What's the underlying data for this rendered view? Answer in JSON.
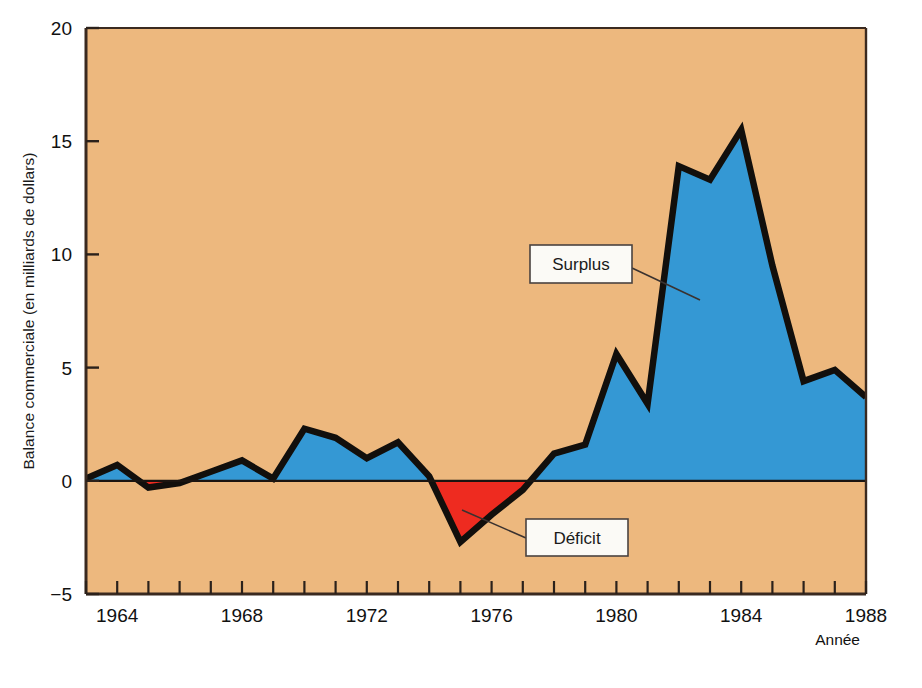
{
  "figure": {
    "background_color": "#ffffff",
    "plot_background_color": "#edb87e",
    "axis_color": "#3a2a20",
    "surplus_color": "#3498d4",
    "deficit_color": "#ee2b20",
    "line_color": "#120f0c"
  },
  "axes": {
    "y_title": "Balance commerciale (en milliards de dollars)",
    "x_title": "Année",
    "y_ticks": [
      "20",
      "15",
      "10",
      "5",
      "0",
      "−5"
    ],
    "x_ticks": [
      "1964",
      "1968",
      "1972",
      "1976",
      "1980",
      "1984",
      "1988"
    ]
  },
  "callouts": {
    "surplus": "Surplus",
    "deficit": "Déficit"
  },
  "chart_data": {
    "type": "area",
    "title": "",
    "subtitle": "",
    "xlabel": "Année",
    "ylabel": "Balance commerciale (en milliards de dollars)",
    "xlim": [
      1963,
      1988
    ],
    "ylim": [
      -5,
      20
    ],
    "yticks": [
      -5,
      0,
      5,
      10,
      15,
      20
    ],
    "xticks": [
      1964,
      1968,
      1972,
      1976,
      1980,
      1984,
      1988
    ],
    "xtick_minor_step": 1,
    "grid": false,
    "legend": "annotations",
    "baseline": 0,
    "units": "milliards de dollars",
    "annotations": [
      {
        "label": "Surplus",
        "points_to_year": 1982,
        "points_to_value": 8.5
      },
      {
        "label": "Déficit",
        "points_to_year": 1975.4,
        "points_to_value": -1.5
      }
    ],
    "series": [
      {
        "name": "Balance commerciale",
        "fill_above_baseline": "#3498d4",
        "fill_below_baseline": "#ee2b20",
        "x": [
          1963,
          1964,
          1965,
          1966,
          1967,
          1968,
          1969,
          1970,
          1971,
          1972,
          1973,
          1974,
          1975,
          1976,
          1977,
          1978,
          1979,
          1980,
          1981,
          1982,
          1983,
          1984,
          1985,
          1986,
          1987,
          1988
        ],
        "values": [
          0.1,
          0.7,
          -0.3,
          -0.1,
          0.4,
          0.9,
          0.1,
          2.3,
          1.9,
          1.0,
          1.7,
          0.2,
          -2.7,
          -1.5,
          -0.4,
          1.2,
          1.6,
          5.6,
          3.4,
          13.9,
          13.3,
          15.5,
          9.5,
          4.4,
          4.9,
          3.7
        ]
      }
    ]
  }
}
